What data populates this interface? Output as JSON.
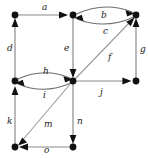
{
  "figure": {
    "type": "directed-graph",
    "width": 148,
    "height": 158,
    "background_color": "#ffffff",
    "node_color": "#111111",
    "edge_color": "#8a8a8a",
    "label_color": "#1a1a1a"
  },
  "nodes": [
    {
      "id": "n1",
      "x": 15,
      "y": 15,
      "name": "node-top-left"
    },
    {
      "id": "n2",
      "x": 73,
      "y": 15,
      "name": "node-top-middle"
    },
    {
      "id": "n3",
      "x": 136,
      "y": 15,
      "name": "node-top-right"
    },
    {
      "id": "n4",
      "x": 15,
      "y": 81,
      "name": "node-middle-left"
    },
    {
      "id": "n5",
      "x": 73,
      "y": 81,
      "name": "node-center"
    },
    {
      "id": "n6",
      "x": 136,
      "y": 81,
      "name": "node-middle-right"
    },
    {
      "id": "n7",
      "x": 15,
      "y": 147,
      "name": "node-bottom-left"
    },
    {
      "id": "n8",
      "x": 73,
      "y": 147,
      "name": "node-bottom-middle"
    }
  ],
  "edges": [
    {
      "label": "a",
      "from": "n1",
      "to": "n2",
      "shape": "straight",
      "label_x": 42,
      "label_y": 3
    },
    {
      "label": "b",
      "from": "n2",
      "to": "n3",
      "shape": "curve-up",
      "label_x": 101,
      "label_y": 11
    },
    {
      "label": "c",
      "from": "n3",
      "to": "n2",
      "shape": "curve-down",
      "label_x": 103,
      "label_y": 27
    },
    {
      "label": "d",
      "from": "n4",
      "to": "n1",
      "shape": "straight",
      "label_x": 7,
      "label_y": 44
    },
    {
      "label": "e",
      "from": "n2",
      "to": "n5",
      "shape": "straight",
      "label_x": 64,
      "label_y": 44
    },
    {
      "label": "f",
      "from": "n5",
      "to": "n3",
      "shape": "straight",
      "label_x": 108,
      "label_y": 53
    },
    {
      "label": "g",
      "from": "n6",
      "to": "n3",
      "shape": "straight",
      "label_x": 140,
      "label_y": 45
    },
    {
      "label": "h",
      "from": "n4",
      "to": "n5",
      "shape": "curve-up",
      "label_x": 43,
      "label_y": 67
    },
    {
      "label": "i",
      "from": "n5",
      "to": "n4",
      "shape": "curve-down",
      "label_x": 43,
      "label_y": 91
    },
    {
      "label": "j",
      "from": "n5",
      "to": "n6",
      "shape": "straight",
      "label_x": 100,
      "label_y": 88
    },
    {
      "label": "k",
      "from": "n7",
      "to": "n4",
      "shape": "straight",
      "label_x": 7,
      "label_y": 117
    },
    {
      "label": "m",
      "from": "n5",
      "to": "n7",
      "shape": "straight",
      "label_x": 44,
      "label_y": 120
    },
    {
      "label": "n",
      "from": "n5",
      "to": "n8",
      "shape": "straight",
      "label_x": 77,
      "label_y": 117
    },
    {
      "label": "o",
      "from": "n8",
      "to": "n7",
      "shape": "straight",
      "label_x": 44,
      "label_y": 146
    }
  ]
}
